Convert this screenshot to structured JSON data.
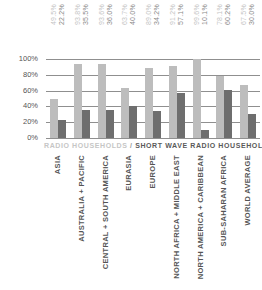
{
  "chart_data": {
    "type": "bar",
    "title": "",
    "xlabel": "",
    "ylabel": "",
    "ylim": [
      0,
      100
    ],
    "yticks": [
      "0%",
      "20%",
      "40%",
      "60%",
      "80%",
      "100%"
    ],
    "grid": true,
    "legend": {
      "position": "bottom",
      "entries": [
        "RADIO HOUSEHOLDS",
        "SHORT WAVE RADIO HOUSEHOLDS"
      ],
      "separator": " / "
    },
    "categories": [
      "ASIA",
      "AUSTRALIA + PACIFIC",
      "CENTRAL + SOUTH AMERICA",
      "EURASIA",
      "EUROPE",
      "NORTH AFRICA + MIDDLE EAST",
      "NORTH AMERICA + CARIBBEAN",
      "SUB-SAHARAN AFRICA",
      "WORLD AVERAGE"
    ],
    "series": [
      {
        "name": "RADIO HOUSEHOLDS",
        "color": "#bdbdbd",
        "values": [
          49.5,
          93.8,
          93.6,
          63.7,
          89.0,
          91.2,
          99.6,
          78.1,
          67.5
        ],
        "labels": [
          "49.5%",
          "93.8%",
          "93.6%",
          "63.7%",
          "89.0%",
          "91.2%",
          "99.6%",
          "78.1%",
          "67.5%"
        ]
      },
      {
        "name": "SHORT WAVE RADIO HOUSEHOLDS",
        "color": "#6e6e6e",
        "values": [
          22.2,
          35.5,
          36.0,
          40.0,
          34.2,
          57.1,
          10.1,
          60.2,
          30.0
        ],
        "labels": [
          "22.2%",
          "35.5%",
          "36.0%",
          "40.0%",
          "34.2%",
          "57.1%",
          "10.1%",
          "60.2%",
          "30.0%"
        ]
      }
    ]
  }
}
